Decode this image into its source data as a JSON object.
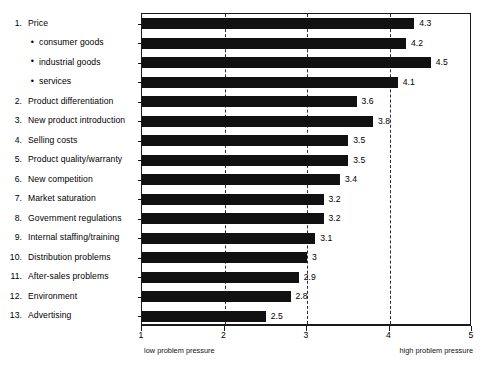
{
  "chart_data": {
    "type": "bar",
    "orientation": "horizontal",
    "title": "",
    "subtitle": "",
    "xlabel": "",
    "ylabel": "",
    "xlim": [
      1,
      5
    ],
    "grid": true,
    "gridlines": [
      2,
      3,
      4
    ],
    "legend": null,
    "bar_color": "#111111",
    "axis_ticks": [
      "1",
      "2",
      "3",
      "4",
      "5"
    ],
    "axis_tick_values": [
      1,
      2,
      3,
      4,
      5
    ],
    "axis_caption_left": "low  problem pressure",
    "axis_caption_right": "high problem pressure",
    "categories": [
      "Price",
      "consumer goods",
      "industrial goods",
      "services",
      "Product differentiation",
      "New product introduction",
      "Selling costs",
      "Product quality/warranty",
      "New competition",
      "Market saturation",
      "Government regulations",
      "Internal staffing/training",
      "Distribution problems",
      "After-sales problems",
      "Environment",
      "Advertising"
    ],
    "values": [
      4.3,
      4.2,
      4.5,
      4.1,
      3.6,
      3.8,
      3.5,
      3.5,
      3.4,
      3.2,
      3.2,
      3.1,
      3,
      2.9,
      2.8,
      2.5
    ],
    "value_labels": [
      "4.3",
      "4.2",
      "4.5",
      "4.1",
      "3.6",
      "3.8",
      "3.5",
      "3.5",
      "3.4",
      "3.2",
      "3.2",
      "3.1",
      "3",
      "2.9",
      "2.8",
      "2.5"
    ],
    "rows": [
      {
        "marker": "1.",
        "sub": false,
        "label": "Price",
        "value": 4.3,
        "value_label": "4.3"
      },
      {
        "marker": "•",
        "sub": true,
        "label": "consumer goods",
        "value": 4.2,
        "value_label": "4.2"
      },
      {
        "marker": "•",
        "sub": true,
        "label": "industrial goods",
        "value": 4.5,
        "value_label": "4.5"
      },
      {
        "marker": "•",
        "sub": true,
        "label": "services",
        "value": 4.1,
        "value_label": "4.1"
      },
      {
        "marker": "2.",
        "sub": false,
        "label": "Product differentiation",
        "value": 3.6,
        "value_label": "3.6"
      },
      {
        "marker": "3.",
        "sub": false,
        "label": "New product introduction",
        "value": 3.8,
        "value_label": "3.8"
      },
      {
        "marker": "4.",
        "sub": false,
        "label": "Selling costs",
        "value": 3.5,
        "value_label": "3.5"
      },
      {
        "marker": "5.",
        "sub": false,
        "label": "Product quality/warranty",
        "value": 3.5,
        "value_label": "3.5"
      },
      {
        "marker": "6.",
        "sub": false,
        "label": "New competition",
        "value": 3.4,
        "value_label": "3.4"
      },
      {
        "marker": "7.",
        "sub": false,
        "label": "Market saturation",
        "value": 3.2,
        "value_label": "3.2"
      },
      {
        "marker": "8.",
        "sub": false,
        "label": "Government regulations",
        "value": 3.2,
        "value_label": "3.2"
      },
      {
        "marker": "9.",
        "sub": false,
        "label": "Internal staffing/training",
        "value": 3.1,
        "value_label": "3.1"
      },
      {
        "marker": "10.",
        "sub": false,
        "label": "Distribution problems",
        "value": 3.0,
        "value_label": "3"
      },
      {
        "marker": "11.",
        "sub": false,
        "label": "After-sales problems",
        "value": 2.9,
        "value_label": "2.9"
      },
      {
        "marker": "12.",
        "sub": false,
        "label": "Environment",
        "value": 2.8,
        "value_label": "2.8"
      },
      {
        "marker": "13.",
        "sub": false,
        "label": "Advertising",
        "value": 2.5,
        "value_label": "2.5"
      }
    ]
  }
}
